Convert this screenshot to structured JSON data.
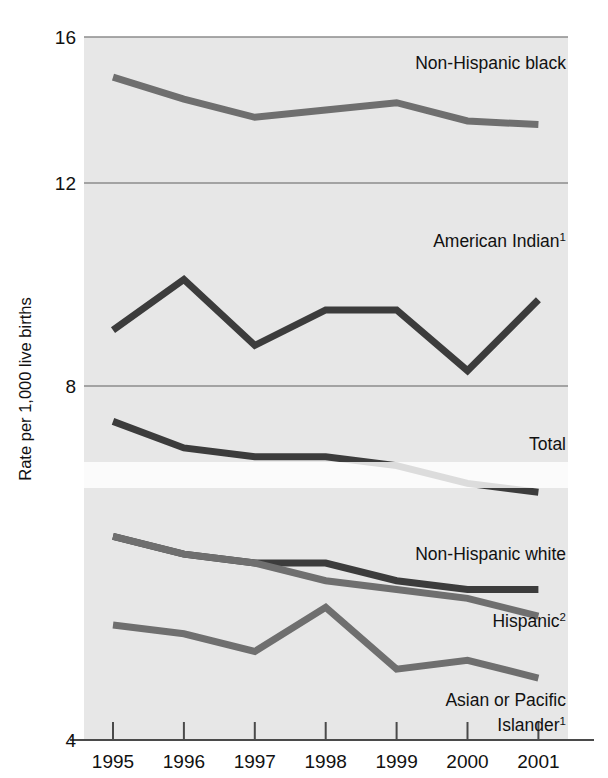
{
  "chart_data": {
    "type": "line",
    "title": "",
    "xlabel": "",
    "ylabel": "Rate per 1,000 live births",
    "x": [
      1995,
      1996,
      1997,
      1998,
      1999,
      2000,
      2001
    ],
    "xtick_labels": [
      "1995",
      "1996",
      "1997",
      "1998",
      "1999",
      "2000",
      "2001"
    ],
    "ytick_labels": [
      "16",
      "12",
      "8",
      "4"
    ],
    "ytick_values": [
      16,
      12,
      8,
      4
    ],
    "ylim": [
      4,
      16
    ],
    "xlim": [
      1995,
      2001
    ],
    "grid": true,
    "legend_position": "inline-right",
    "series": [
      {
        "name": "Non-Hispanic black",
        "label": "Non-Hispanic black",
        "superscript": "",
        "color": "#6f6f6f",
        "values": [
          14.9,
          14.3,
          13.8,
          14.0,
          14.2,
          13.7,
          13.6
        ],
        "label_x": 2000.0,
        "label_y": 15.3
      },
      {
        "name": "American Indian",
        "label": "American Indian",
        "superscript": "1",
        "color": "#3c3c3c",
        "values": [
          9.1,
          10.1,
          8.8,
          9.5,
          9.5,
          8.3,
          9.7
        ],
        "label_x": 2000.05,
        "label_y": 10.85
      },
      {
        "name": "Total",
        "label": "Total",
        "superscript": "",
        "color": "#3c3c3c",
        "values": [
          7.6,
          7.3,
          7.2,
          7.2,
          7.1,
          6.9,
          6.8
        ],
        "label_x": 2000.95,
        "label_y": 7.35
      },
      {
        "name": "Non-Hispanic white",
        "label": "Non-Hispanic white",
        "superscript": "",
        "color": "#3c3c3c",
        "values": [
          6.3,
          6.1,
          6.0,
          6.0,
          5.8,
          5.7,
          5.7
        ],
        "label_x": 2000.95,
        "label_y": 6.1
      },
      {
        "name": "Hispanic",
        "label": "Hispanic",
        "superscript": "2",
        "color": "#6f6f6f",
        "values": [
          6.3,
          6.1,
          6.0,
          5.8,
          5.7,
          5.6,
          5.4
        ],
        "label_x": 2000.9,
        "label_y": 5.35
      },
      {
        "name": "Asian or Pacific Islander",
        "label": "Asian or Pacific Islander",
        "label_line1": "Asian or Pacific",
        "label_line2": "Islander",
        "superscript": "1",
        "color": "#6f6f6f",
        "values": [
          5.3,
          5.2,
          5.0,
          5.5,
          4.8,
          4.9,
          4.7
        ],
        "label_x": 2000.9,
        "label_y": 4.45
      }
    ]
  },
  "axis": {
    "y_title": "Rate per 1,000 live births",
    "y_ticks": [
      "16",
      "12",
      "8",
      "4"
    ],
    "x_ticks": [
      "1995",
      "1996",
      "1997",
      "1998",
      "1999",
      "2000",
      "2001"
    ]
  },
  "labels": {
    "non_hispanic_black": "Non-Hispanic black",
    "american_indian": "American Indian",
    "american_indian_sup": "1",
    "total": "Total",
    "non_hispanic_white": "Non-Hispanic white",
    "hispanic": "Hispanic",
    "hispanic_sup": "2",
    "asian_pacific_line1": "Asian or Pacific",
    "asian_pacific_line2": "Islander",
    "asian_pacific_sup": "1"
  },
  "colors": {
    "plot_background": "#e7e7e7",
    "page_background": "#ffffff",
    "gridline": "#8d8d8d",
    "axis_line": "#4a4a4a",
    "series_dark": "#3c3c3c",
    "series_gray": "#6f6f6f",
    "text": "#111111"
  }
}
